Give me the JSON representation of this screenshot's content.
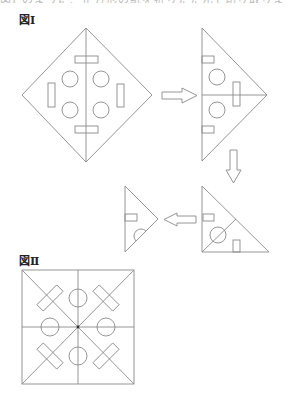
{
  "header": {
    "cut_text": "図Ⅰ のように、正方形の紙を折りたたんで切り取ります。"
  },
  "figures": {
    "fig1_label": "図Ⅰ",
    "fig2_label": "図Ⅱ"
  },
  "colors": {
    "line": "#8a8a8a",
    "text": "#222222",
    "background": "#ffffff"
  },
  "diagram": {
    "diamond": {
      "outline": [
        [
          86,
          28
        ],
        [
          152,
          95
        ],
        [
          86,
          162
        ],
        [
          22,
          95
        ]
      ],
      "fold_line": [
        [
          86,
          28
        ],
        [
          86,
          162
        ]
      ],
      "rects": [
        {
          "x": 75,
          "y": 56,
          "w": 23,
          "h": 7
        },
        {
          "x": 75,
          "y": 126,
          "w": 23,
          "h": 7
        },
        {
          "x": 48,
          "y": 83,
          "w": 7,
          "h": 24
        },
        {
          "x": 117,
          "y": 84,
          "w": 7,
          "h": 23
        }
      ],
      "circles": [
        {
          "cx": 70,
          "cy": 79,
          "r": 8
        },
        {
          "cx": 101,
          "cy": 79,
          "r": 8
        },
        {
          "cx": 70,
          "cy": 110,
          "r": 8
        },
        {
          "cx": 101,
          "cy": 110,
          "r": 8
        }
      ]
    },
    "triangle_half": {
      "outline": [
        [
          202,
          28
        ],
        [
          267,
          95
        ],
        [
          202,
          161
        ]
      ],
      "fold_line": [
        [
          202,
          95
        ],
        [
          267,
          95
        ]
      ],
      "rects": [
        {
          "x": 202,
          "y": 56,
          "w": 12,
          "h": 7
        },
        {
          "x": 202,
          "y": 126,
          "w": 12,
          "h": 7
        },
        {
          "x": 233,
          "y": 82,
          "w": 7,
          "h": 24
        }
      ],
      "circles": [
        {
          "cx": 217,
          "cy": 77,
          "r": 8
        },
        {
          "cx": 217,
          "cy": 110,
          "r": 8
        }
      ]
    },
    "triangle_quarter": {
      "outline": [
        [
          202,
          186
        ],
        [
          269,
          252
        ],
        [
          202,
          252
        ]
      ],
      "fold_line": [
        [
          202,
          252
        ],
        [
          236,
          219
        ]
      ],
      "rects": [
        {
          "x": 203,
          "y": 214,
          "w": 11,
          "h": 7
        },
        {
          "x": 233,
          "y": 240,
          "w": 7,
          "h": 12
        }
      ],
      "circles": [
        {
          "cx": 218,
          "cy": 235,
          "r": 8
        }
      ]
    },
    "triangle_eighth": {
      "outline": [
        [
          125,
          186
        ],
        [
          158,
          219
        ],
        [
          125,
          252
        ]
      ],
      "rects": [
        {
          "x": 125,
          "y": 214,
          "w": 12,
          "h": 7
        }
      ],
      "semicircles": [
        {
          "cx": 141,
          "cy": 236,
          "r": 7
        }
      ]
    },
    "arrows": [
      {
        "direction": "right",
        "points": [
          [
            162,
            92
          ],
          [
            182,
            92
          ],
          [
            182,
            88
          ],
          [
            197,
            95.5
          ],
          [
            182,
            103
          ],
          [
            182,
            99
          ],
          [
            162,
            99
          ]
        ]
      },
      {
        "direction": "down",
        "points": [
          [
            230,
            150
          ],
          [
            237,
            150
          ],
          [
            237,
            170
          ],
          [
            241,
            170
          ],
          [
            233.5,
            183
          ],
          [
            226,
            170
          ],
          [
            230,
            170
          ]
        ]
      },
      {
        "direction": "left",
        "points": [
          [
            196,
            216
          ],
          [
            177,
            216
          ],
          [
            177,
            213
          ],
          [
            164,
            219.5
          ],
          [
            177,
            226
          ],
          [
            177,
            223
          ],
          [
            196,
            223
          ]
        ]
      }
    ],
    "square": {
      "x": 22,
      "y": 270,
      "w": 112,
      "h": 114,
      "center": [
        78,
        327
      ],
      "circles": [
        {
          "cx": 78,
          "cy": 298,
          "r": 9
        },
        {
          "cx": 78,
          "cy": 356,
          "r": 9
        },
        {
          "cx": 50,
          "cy": 327,
          "r": 9
        },
        {
          "cx": 106,
          "cy": 327,
          "r": 9
        }
      ],
      "rotated_rects": [
        {
          "cx": 50,
          "cy": 298,
          "len": 28,
          "wid": 9,
          "angle": -45
        },
        {
          "cx": 106,
          "cy": 298,
          "len": 28,
          "wid": 9,
          "angle": 45
        },
        {
          "cx": 50,
          "cy": 356,
          "len": 28,
          "wid": 9,
          "angle": 45
        },
        {
          "cx": 106,
          "cy": 356,
          "len": 28,
          "wid": 9,
          "angle": -45
        }
      ]
    }
  }
}
